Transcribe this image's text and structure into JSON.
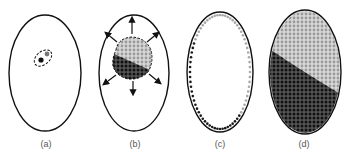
{
  "figure": {
    "panels": [
      {
        "id": "a",
        "label": "(a)",
        "description": "cell with small dashed region containing two dots"
      },
      {
        "id": "b",
        "label": "(b)",
        "description": "expanding cluster of light and dark cells with outward arrows"
      },
      {
        "id": "c",
        "label": "(c)",
        "description": "cells arranged as single layer along the boundary, light on one side, dark on the other"
      },
      {
        "id": "d",
        "label": "(d)",
        "description": "ellipse fully filled, light cells top-right region, dark cells bottom-left region"
      }
    ],
    "colors": {
      "outline": "#111111",
      "dark_cell": "#1a1a1a",
      "light_cell": "#a8a8a8",
      "label": "#555555"
    }
  }
}
